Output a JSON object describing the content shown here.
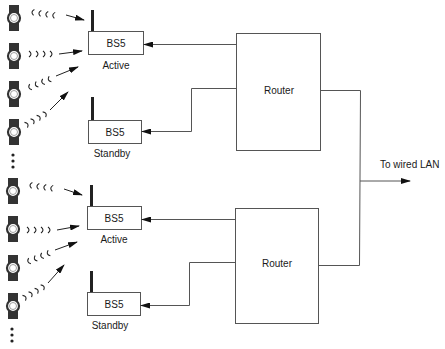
{
  "diagram": {
    "groups": [
      {
        "router": {
          "label": "Router"
        },
        "base_stations": [
          {
            "label": "BS5",
            "status": "Active"
          },
          {
            "label": "BS5",
            "status": "Standby"
          }
        ],
        "devices": 4,
        "more_devices_indicator": "⋮"
      },
      {
        "router": {
          "label": "Router"
        },
        "base_stations": [
          {
            "label": "BS5",
            "status": "Active"
          },
          {
            "label": "BS5",
            "status": "Standby"
          }
        ],
        "devices": 4,
        "more_devices_indicator": "⋮"
      }
    ],
    "uplink": {
      "label": "To wired LAN"
    },
    "colors": {
      "line": "#555555",
      "device": "#333333",
      "text": "#1a1a1a",
      "background": "#ffffff"
    }
  }
}
